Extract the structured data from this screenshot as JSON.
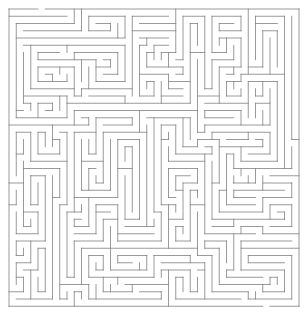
{
  "figure": {
    "kind": "maze-puzzle",
    "width_px": 308,
    "height_px": 319,
    "background_color": "#ffffff"
  },
  "maze": {
    "columns": 40,
    "rows": 41,
    "cell_size_px": 7.25,
    "origin_x_px": 9,
    "origin_y_px": 9,
    "wall_color": "#808080",
    "wall_thickness_px": 0.8,
    "border_color": "#808080",
    "border_thickness_px": 0.9,
    "algorithm": "recursive-backtracker",
    "seed": 20250517,
    "entrance": {
      "side": "top",
      "column": 4
    },
    "exit": {
      "side": "bottom",
      "column": 35
    },
    "perfect": true,
    "description": "Single-solution rectangular grid maze drawn as thin gray passage walls on a white field."
  }
}
